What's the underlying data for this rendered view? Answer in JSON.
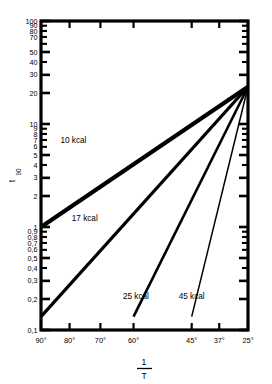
{
  "chart_data": {
    "type": "line",
    "title": "",
    "subtitle": "",
    "xlabel_numerator": "1",
    "xlabel_denominator": "T",
    "ylabel_main": "t",
    "ylabel_sub": "90",
    "xscale": "inverse-temperature",
    "yscale": "log",
    "ylim": [
      0.1,
      100
    ],
    "grid": false,
    "legend": "inline-annotations",
    "x_tick_labels": [
      "90°",
      "80°",
      "70°",
      "60°",
      "45°",
      "37°",
      "25°"
    ],
    "x_tick_temps_c": [
      90,
      80,
      70,
      60,
      45,
      37,
      25
    ],
    "x_tick_positions_frac": [
      0.0,
      0.138,
      0.287,
      0.447,
      0.728,
      0.861,
      1.0
    ],
    "y_tick_labels": [
      "100",
      "90",
      "80",
      "70",
      "50",
      "40",
      "30",
      "20",
      "10",
      "9",
      "8",
      "7",
      "6",
      "5",
      "4",
      "3",
      "2",
      "1",
      "0,9",
      "0,8",
      "0,7",
      "0,6",
      "0,5",
      "0,4",
      "0,3",
      "0,2",
      "0,1"
    ],
    "y_tick_values": [
      100,
      90,
      80,
      70,
      50,
      40,
      30,
      20,
      10,
      9,
      8,
      7,
      6,
      5,
      4,
      3,
      2,
      1,
      0.9,
      0.8,
      0.7,
      0.6,
      0.5,
      0.4,
      0.3,
      0.2,
      0.1
    ],
    "convergence_point": {
      "x_label": "25°",
      "y_value": 23
    },
    "series": [
      {
        "name": "10 kcal",
        "label": "10 kcal",
        "activation_energy_kcal": 10,
        "stroke_width": 4.2,
        "start": {
          "x_label": "90°",
          "y_value": 1.0
        },
        "end": {
          "x_label": "25°",
          "y_value": 23
        },
        "label_pos": {
          "x_label": "78°",
          "y_value": 6.6
        }
      },
      {
        "name": "17 kcal",
        "label": "17 kcal",
        "activation_energy_kcal": 17,
        "stroke_width": 3.2,
        "start": {
          "x_label": "90°",
          "y_value": 0.135
        },
        "end": {
          "x_label": "25°",
          "y_value": 23
        },
        "label_pos": {
          "x_label": "74°",
          "y_value": 1.15
        }
      },
      {
        "name": "25 kcal",
        "label": "25 kcal",
        "activation_energy_kcal": 25,
        "stroke_width": 2.6,
        "start": {
          "x_label": "60°",
          "y_value": 0.135
        },
        "end": {
          "x_label": "25°",
          "y_value": 23
        },
        "label_pos": {
          "x_label": "57°",
          "y_value": 0.2
        }
      },
      {
        "name": "45 kcal",
        "label": "45 kcal",
        "activation_energy_kcal": 45,
        "stroke_width": 1.5,
        "start": {
          "x_label": "45°",
          "y_value": 0.135
        },
        "end": {
          "x_label": "25°",
          "y_value": 23
        },
        "label_pos": {
          "x_label": "45°",
          "y_value": 0.2
        }
      }
    ]
  },
  "axes": {
    "plot_frame": {
      "left": 41,
      "top": 21,
      "right": 248,
      "bottom": 330
    },
    "frame_stroke": "#000000",
    "frame_width": 3.2
  },
  "colors": {
    "background": "#ffffff",
    "ink": "#000000"
  }
}
